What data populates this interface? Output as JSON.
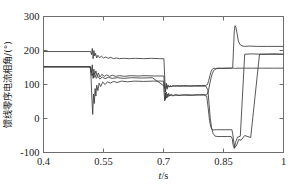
{
  "chart_data": {
    "type": "line",
    "title": "",
    "xlabel": "t/s",
    "ylabel": "馈线零序电流相角/(°)",
    "xlabel_italic_part": "t",
    "xlabel_rest": "/s",
    "xlim": [
      0.4,
      1.0
    ],
    "ylim": [
      -100,
      300
    ],
    "xticks": [
      0.4,
      0.55,
      0.7,
      0.85,
      1
    ],
    "xticklabels": [
      "0.4",
      "0.55",
      "0.7",
      "0.85",
      "1"
    ],
    "yticks": [
      -100,
      0,
      100,
      200,
      300
    ],
    "yticklabels": [
      "-100",
      "0",
      "100",
      "200",
      "300"
    ],
    "grid": false,
    "legend": false,
    "line_color": "#3a3a3a",
    "frame_color": "#6e6e6e",
    "series": [
      {
        "name": "feeder-1",
        "color": "#3a3a3a",
        "x": [
          0.4,
          0.515,
          0.518,
          0.52,
          0.522,
          0.524,
          0.526,
          0.528,
          0.53,
          0.533,
          0.536,
          0.54,
          0.545,
          0.55,
          0.556,
          0.562,
          0.568,
          0.575,
          0.582,
          0.59,
          0.6,
          0.615,
          0.63,
          0.65,
          0.67,
          0.69,
          0.7,
          0.701,
          0.703,
          0.705,
          0.707,
          0.709,
          0.711,
          0.714,
          0.717,
          0.72,
          0.724,
          0.728,
          0.733,
          0.74,
          0.75,
          0.765,
          0.78,
          0.795,
          0.805,
          0.81,
          0.813,
          0.816,
          0.819,
          0.822,
          0.826,
          0.83,
          0.836,
          0.845,
          0.86,
          0.87,
          0.873,
          0.875,
          0.877,
          0.879,
          0.881,
          0.884,
          0.887,
          0.891,
          0.896,
          0.903,
          0.915,
          0.935,
          0.96,
          1.0
        ],
        "y": [
          197,
          197,
          197,
          188,
          206,
          176,
          200,
          184,
          192,
          178,
          186,
          179,
          183,
          178,
          181,
          177,
          180,
          176,
          178,
          176,
          177,
          176,
          177,
          176,
          177,
          176,
          176,
          176,
          122,
          78,
          104,
          86,
          99,
          92,
          97,
          94,
          97,
          96,
          97,
          96,
          97,
          96,
          97,
          97,
          97,
          100,
          112,
          126,
          138,
          145,
          148,
          147,
          148,
          147,
          148,
          148,
          150,
          205,
          258,
          273,
          268,
          250,
          228,
          218,
          214,
          212,
          213,
          212,
          212,
          212
        ]
      },
      {
        "name": "feeder-2",
        "color": "#3a3a3a",
        "x": [
          0.4,
          0.515,
          0.518,
          0.52,
          0.522,
          0.524,
          0.526,
          0.528,
          0.531,
          0.534,
          0.537,
          0.541,
          0.546,
          0.552,
          0.558,
          0.565,
          0.572,
          0.58,
          0.59,
          0.602,
          0.618,
          0.636,
          0.656,
          0.678,
          0.7,
          0.701,
          0.703,
          0.705,
          0.707,
          0.71,
          0.713,
          0.716,
          0.72,
          0.725,
          0.731,
          0.74,
          0.755,
          0.772,
          0.79,
          0.805,
          0.81,
          0.813,
          0.816,
          0.819,
          0.822,
          0.825,
          0.829,
          0.834,
          0.842,
          0.855,
          0.868,
          0.871,
          0.873,
          0.875,
          0.877,
          0.88,
          0.884,
          0.889,
          0.895,
          0.905,
          0.92,
          0.945,
          0.975,
          1.0
        ],
        "y": [
          152,
          152,
          152,
          135,
          158,
          118,
          145,
          128,
          140,
          124,
          134,
          122,
          130,
          124,
          128,
          124,
          127,
          124,
          126,
          124,
          126,
          125,
          126,
          125,
          125,
          125,
          86,
          56,
          78,
          62,
          74,
          66,
          71,
          67,
          70,
          68,
          70,
          69,
          70,
          70,
          72,
          86,
          104,
          120,
          132,
          140,
          145,
          147,
          148,
          148,
          148,
          148,
          148,
          148,
          148,
          147,
          148,
          148,
          148,
          148,
          148,
          148,
          148,
          148
        ]
      },
      {
        "name": "feeder-3",
        "color": "#3a3a3a",
        "x": [
          0.4,
          0.515,
          0.517,
          0.519,
          0.521,
          0.523,
          0.525,
          0.527,
          0.529,
          0.531,
          0.533,
          0.536,
          0.539,
          0.543,
          0.548,
          0.554,
          0.56,
          0.567,
          0.575,
          0.584,
          0.595,
          0.61,
          0.628,
          0.65,
          0.675,
          0.7,
          0.701,
          0.703,
          0.705,
          0.707,
          0.71,
          0.713,
          0.717,
          0.722,
          0.728,
          0.736,
          0.748,
          0.764,
          0.782,
          0.8,
          0.808,
          0.812,
          0.815,
          0.818,
          0.821,
          0.824,
          0.828,
          0.833,
          0.841,
          0.854,
          0.868,
          0.871,
          0.873,
          0.876,
          0.879,
          0.883,
          0.888,
          0.894,
          0.903,
          0.918,
          0.94,
          0.968,
          1.0
        ],
        "y": [
          152,
          152,
          152,
          118,
          60,
          12,
          72,
          44,
          88,
          66,
          98,
          82,
          104,
          94,
          107,
          100,
          108,
          104,
          109,
          106,
          110,
          108,
          110,
          109,
          110,
          110,
          84,
          52,
          75,
          60,
          72,
          65,
          70,
          67,
          69,
          68,
          69,
          68,
          69,
          69,
          66,
          28,
          -6,
          -24,
          -32,
          -34,
          -33,
          -33,
          -33,
          -33,
          -33,
          -33,
          -45,
          -72,
          -85,
          -78,
          -62,
          -64,
          -50,
          -56,
          189,
          189,
          189
        ]
      },
      {
        "name": "feeder-4",
        "color": "#3a3a3a",
        "x": [
          0.4,
          0.516,
          0.519,
          0.521,
          0.523,
          0.526,
          0.529,
          0.532,
          0.536,
          0.541,
          0.547,
          0.554,
          0.562,
          0.572,
          0.584,
          0.6,
          0.62,
          0.645,
          0.672,
          0.7,
          0.701,
          0.703,
          0.706,
          0.709,
          0.712,
          0.716,
          0.721,
          0.727,
          0.735,
          0.746,
          0.76,
          0.778,
          0.796,
          0.806,
          0.811,
          0.814,
          0.817,
          0.82,
          0.824,
          0.829,
          0.836,
          0.846,
          0.86,
          0.869,
          0.872,
          0.874,
          0.877,
          0.88,
          0.885,
          0.892,
          0.903,
          0.92,
          0.945,
          0.975,
          1.0
        ],
        "y": [
          152,
          152,
          140,
          126,
          132,
          120,
          128,
          118,
          124,
          116,
          122,
          117,
          121,
          118,
          120,
          118,
          120,
          119,
          120,
          97,
          97,
          90,
          94,
          92,
          95,
          94,
          95,
          95,
          95,
          95,
          95,
          95,
          95,
          95,
          84,
          40,
          0,
          -26,
          -44,
          -52,
          -53,
          -53,
          -53,
          -53,
          -60,
          -78,
          -88,
          -70,
          -55,
          -52,
          189,
          190,
          189,
          190,
          189
        ]
      }
    ]
  },
  "axis": {
    "x_tick_positions": [
      0.4,
      0.55,
      0.7,
      0.85,
      1
    ],
    "y_tick_positions": [
      -100,
      0,
      100,
      200,
      300
    ]
  }
}
